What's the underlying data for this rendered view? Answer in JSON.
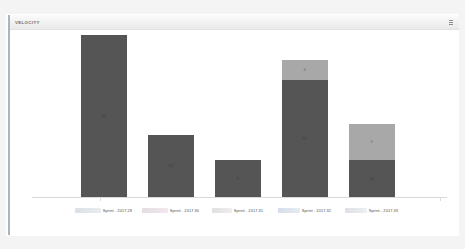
{
  "widget": {
    "title": "VELOCITY",
    "menu_icon": "kebab-menu-icon"
  },
  "colors": {
    "committed": "#a8a8a8",
    "completed": "#555555",
    "card_background": "#ffffff",
    "page_background": "#f2f2f2",
    "rail": "#9aa7b4"
  },
  "chart_data": {
    "type": "bar",
    "title": "VELOCITY",
    "xlabel": "",
    "ylabel": "",
    "grid": false,
    "legend_position": "none",
    "stacked": true,
    "categories": [
      "Sprint - 2017.29",
      "Sprint - 2017.30",
      "Sprint - 2017.31",
      "Sprint - 2017.32",
      "Sprint - 2017.33"
    ],
    "category_prefixes": [
      "",
      "",
      "",
      "",
      ""
    ],
    "series": [
      {
        "name": "Completed",
        "values": [
          34,
          13,
          8,
          29,
          10
        ]
      },
      {
        "name": "Remaining",
        "values": [
          0,
          0,
          0,
          4,
          9
        ]
      }
    ],
    "ylim": [
      0,
      36
    ]
  },
  "bars": [
    {
      "label": "Sprint - 2017.29",
      "bottom_height": 162,
      "top_height": 0,
      "bottom_value": "34",
      "top_value": ""
    },
    {
      "label": "Sprint - 2017.30",
      "bottom_height": 62,
      "top_height": 0,
      "bottom_value": "13",
      "top_value": ""
    },
    {
      "label": "Sprint - 2017.31",
      "bottom_height": 37,
      "top_height": 0,
      "bottom_value": "8",
      "top_value": ""
    },
    {
      "label": "Sprint - 2017.32",
      "bottom_height": 117,
      "top_height": 20,
      "bottom_value": "29",
      "top_value": "4"
    },
    {
      "label": "Sprint - 2017.33",
      "bottom_height": 37,
      "top_height": 36,
      "bottom_value": "10",
      "top_value": "9"
    }
  ]
}
